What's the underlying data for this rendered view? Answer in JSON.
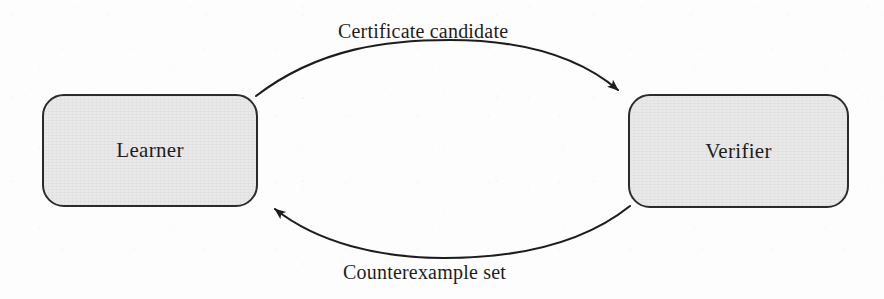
{
  "diagram": {
    "type": "cycle-flow-diagram",
    "background_color": "#fdfdfd",
    "nodes": [
      {
        "id": "learner",
        "label": "Learner",
        "shape": "rounded-rectangle",
        "fill_color": "#e9e9e9",
        "border_color": "#2b2b2b",
        "x": 42,
        "y": 94,
        "width": 216,
        "height": 113
      },
      {
        "id": "verifier",
        "label": "Verifier",
        "shape": "rounded-rectangle",
        "fill_color": "#e9e9e9",
        "border_color": "#2b2b2b",
        "x": 628,
        "y": 94,
        "width": 221,
        "height": 114
      }
    ],
    "edges": [
      {
        "id": "learner-to-verifier",
        "label": "Certificate candidate",
        "from": "learner",
        "to": "verifier",
        "direction": "left-to-right",
        "curve": "arc-above",
        "stroke_color": "#1d1d1d",
        "label_x": 445,
        "label_y": 20
      },
      {
        "id": "verifier-to-learner",
        "label": "Counterexample set",
        "from": "verifier",
        "to": "learner",
        "direction": "right-to-left",
        "curve": "arc-below",
        "stroke_color": "#1d1d1d",
        "label_x": 444,
        "label_y": 261
      }
    ],
    "artifacts": {
      "bleed_through_text": "Verifier"
    }
  }
}
